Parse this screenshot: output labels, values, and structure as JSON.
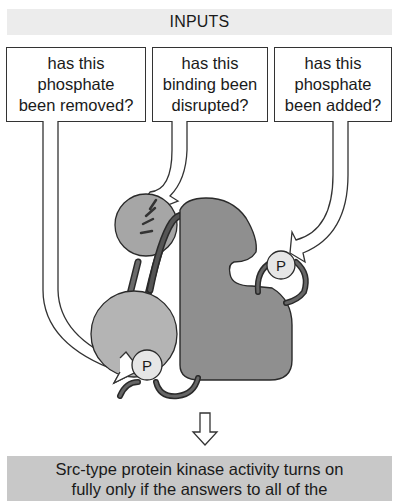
{
  "header": {
    "title": "INPUTS"
  },
  "questions": [
    {
      "id": "q1",
      "lines": [
        "has this",
        "phosphate",
        "been removed?"
      ]
    },
    {
      "id": "q2",
      "lines": [
        "has this",
        "binding been",
        "disrupted?"
      ]
    },
    {
      "id": "q3",
      "lines": [
        "has this",
        "phosphate",
        "been added?"
      ]
    }
  ],
  "diagram": {
    "phosphate_label": "P",
    "colors": {
      "kinase_domain": "#8f8f8f",
      "sh2_domain": "#b4b4b4",
      "sh3_domain": "#a6a6a6",
      "phosphate": "#e6e6e6",
      "linker": "#5a5a5a",
      "outline": "#2a2a2a",
      "banner": "#ececec",
      "result_box": "#c8c8c8"
    }
  },
  "result": {
    "lines": [
      "Src-type protein kinase activity turns on",
      "fully only if the answers to all of the"
    ]
  }
}
